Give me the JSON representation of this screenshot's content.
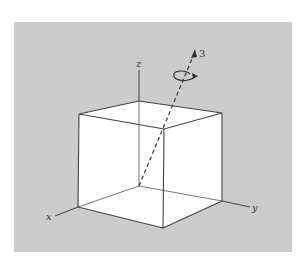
{
  "figure": {
    "type": "3d-cube-rotation-axis",
    "colors": {
      "panel_background": "#cccccc",
      "page_background": "#ffffff",
      "cube_face": "#ffffff",
      "line": "#444444"
    },
    "labels": {
      "x_axis": "x",
      "y_axis": "y",
      "z_axis": "z",
      "rotation_axis": "3"
    },
    "rotation_axis": {
      "style": "dashed",
      "from": "origin",
      "to": "upper-right diagonal",
      "has_rotation_arrow": true
    }
  }
}
